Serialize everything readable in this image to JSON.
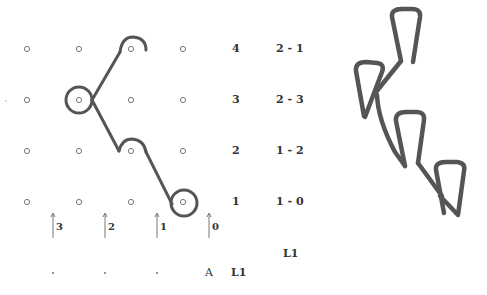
{
  "diagram": {
    "colors": {
      "strand": "#555555",
      "grid_dot": "#777777",
      "text": "#333333",
      "background": "#ffffff"
    },
    "grid": {
      "columns_x": [
        27,
        79,
        131,
        183
      ],
      "rows_y": [
        49,
        100,
        151,
        202
      ],
      "dot_radius": 2.6
    },
    "row_labels": [
      {
        "level": "4",
        "pair": "2 - 1",
        "y": 49
      },
      {
        "level": "3",
        "pair": "2 - 3",
        "y": 100
      },
      {
        "level": "2",
        "pair": "1 - 2",
        "y": 151
      },
      {
        "level": "1",
        "pair": "1 - 0",
        "y": 202
      }
    ],
    "arrows": [
      {
        "x": 53,
        "label": "3"
      },
      {
        "x": 105,
        "label": "2"
      },
      {
        "x": 157,
        "label": "1"
      },
      {
        "x": 209,
        "label": "0"
      }
    ],
    "bottom_row": {
      "dots_x": [
        53,
        105,
        157
      ],
      "a_label": "A",
      "l1_label": "L1"
    },
    "side_label": "L1",
    "left_stray_dot": {
      "x": 6,
      "y": 101
    }
  }
}
